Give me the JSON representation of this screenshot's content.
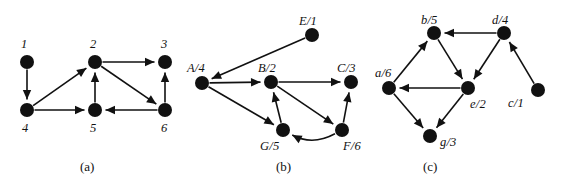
{
  "figure": {
    "width": 576,
    "height": 185,
    "background": "#ffffff",
    "ink_color": "#111111"
  },
  "panels": [
    {
      "id": "panel-a",
      "caption": "(a)",
      "caption_pos": {
        "x": 80,
        "y": 160
      },
      "origin": {
        "x": 0,
        "y": 0
      },
      "node_radius": 7,
      "nodes": [
        {
          "id": "1",
          "label": "1",
          "x": 27,
          "y": 62,
          "label_x": 21,
          "label_y": 38
        },
        {
          "id": "2",
          "label": "2",
          "x": 95,
          "y": 62,
          "label_x": 90,
          "label_y": 38
        },
        {
          "id": "3",
          "label": "3",
          "x": 165,
          "y": 62,
          "label_x": 161,
          "label_y": 38
        },
        {
          "id": "4",
          "label": "4",
          "x": 27,
          "y": 110,
          "label_x": 22,
          "label_y": 122
        },
        {
          "id": "5",
          "label": "5",
          "x": 95,
          "y": 110,
          "label_x": 90,
          "label_y": 122
        },
        {
          "id": "6",
          "label": "6",
          "x": 165,
          "y": 110,
          "label_x": 161,
          "label_y": 122
        }
      ],
      "edges": [
        {
          "from": "1",
          "to": "4"
        },
        {
          "from": "4",
          "to": "2"
        },
        {
          "from": "4",
          "to": "5"
        },
        {
          "from": "5",
          "to": "2"
        },
        {
          "from": "2",
          "to": "3"
        },
        {
          "from": "2",
          "to": "6"
        },
        {
          "from": "6",
          "to": "3"
        },
        {
          "from": "6",
          "to": "5"
        }
      ]
    },
    {
      "id": "panel-b",
      "caption": "(b)",
      "caption_pos": {
        "x": 276,
        "y": 160
      },
      "origin": {
        "x": 0,
        "y": 0
      },
      "node_radius": 7,
      "nodes": [
        {
          "id": "A",
          "label": "A/4",
          "x": 202,
          "y": 83,
          "label_x": 187,
          "label_y": 62
        },
        {
          "id": "B",
          "label": "B/2",
          "x": 271,
          "y": 82,
          "label_x": 258,
          "label_y": 62
        },
        {
          "id": "C",
          "label": "C/3",
          "x": 351,
          "y": 82,
          "label_x": 337,
          "label_y": 62
        },
        {
          "id": "E",
          "label": "E/1",
          "x": 312,
          "y": 35,
          "label_x": 299,
          "label_y": 15
        },
        {
          "id": "G",
          "label": "G/5",
          "x": 283,
          "y": 130,
          "label_x": 260,
          "label_y": 140
        },
        {
          "id": "F",
          "label": "F/6",
          "x": 342,
          "y": 130,
          "label_x": 343,
          "label_y": 140
        }
      ],
      "edges": [
        {
          "from": "E",
          "to": "A"
        },
        {
          "from": "A",
          "to": "B"
        },
        {
          "from": "A",
          "to": "G"
        },
        {
          "from": "B",
          "to": "C"
        },
        {
          "from": "B",
          "to": "F"
        },
        {
          "from": "G",
          "to": "B"
        },
        {
          "from": "F",
          "to": "C"
        },
        {
          "from": "F",
          "to": "G",
          "curved": true
        }
      ]
    },
    {
      "id": "panel-c",
      "caption": "(c)",
      "caption_pos": {
        "x": 423,
        "y": 160
      },
      "origin": {
        "x": 0,
        "y": 0
      },
      "node_radius": 7,
      "nodes": [
        {
          "id": "a",
          "label": "a/6",
          "x": 389,
          "y": 88,
          "label_x": 375,
          "label_y": 67
        },
        {
          "id": "b",
          "label": "b/5",
          "x": 434,
          "y": 33,
          "label_x": 421,
          "label_y": 14
        },
        {
          "id": "d",
          "label": "d/4",
          "x": 504,
          "y": 33,
          "label_x": 492,
          "label_y": 14
        },
        {
          "id": "e",
          "label": "e/2",
          "x": 468,
          "y": 88,
          "label_x": 470,
          "label_y": 98
        },
        {
          "id": "g",
          "label": "g/3",
          "x": 430,
          "y": 136,
          "label_x": 440,
          "label_y": 136
        },
        {
          "id": "c",
          "label": "c/1",
          "x": 538,
          "y": 90,
          "label_x": 508,
          "label_y": 97
        }
      ],
      "edges": [
        {
          "from": "d",
          "to": "b"
        },
        {
          "from": "a",
          "to": "b"
        },
        {
          "from": "b",
          "to": "e"
        },
        {
          "from": "d",
          "to": "e"
        },
        {
          "from": "c",
          "to": "d"
        },
        {
          "from": "e",
          "to": "a"
        },
        {
          "from": "a",
          "to": "g"
        },
        {
          "from": "e",
          "to": "g"
        }
      ]
    }
  ]
}
